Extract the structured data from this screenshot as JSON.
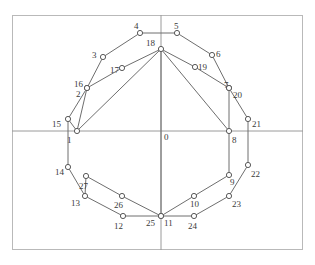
{
  "figure": {
    "title": "",
    "frame": {
      "x": 12,
      "y": 15,
      "width": 291,
      "height": 235,
      "border_color": "#b9b9b9"
    },
    "axes": {
      "x_axis_y": 131,
      "y_axis_x": 161,
      "color": "#9a9a9a",
      "origin_label": "0"
    },
    "style": {
      "edge_color": "#6e6e6e",
      "node_stroke": "#5a5a5a",
      "node_fill": "#ffffff",
      "label_color": "#3a3a3a",
      "background": "#ffffff"
    },
    "nodes": [
      {
        "id": "0",
        "label": "0",
        "x": 161,
        "y": 131,
        "marker": false,
        "lx": 164,
        "ly": 133
      },
      {
        "id": "1",
        "label": "1",
        "x": 77,
        "y": 131,
        "marker": true,
        "lx": 67,
        "ly": 136
      },
      {
        "id": "2",
        "label": "2",
        "x": 87,
        "y": 88,
        "marker": true,
        "lx": 76,
        "ly": 90
      },
      {
        "id": "3",
        "label": "3",
        "x": 103,
        "y": 57,
        "marker": true,
        "lx": 92,
        "ly": 51
      },
      {
        "id": "4",
        "label": "4",
        "x": 140,
        "y": 33,
        "marker": true,
        "lx": 134,
        "ly": 22
      },
      {
        "id": "5",
        "label": "5",
        "x": 177,
        "y": 33,
        "marker": true,
        "lx": 174,
        "ly": 22
      },
      {
        "id": "6",
        "label": "6",
        "x": 212,
        "y": 55,
        "marker": true,
        "lx": 216,
        "ly": 50
      },
      {
        "id": "7",
        "label": "7",
        "x": 229,
        "y": 88,
        "marker": true,
        "lx": 224,
        "ly": 81
      },
      {
        "id": "8",
        "label": "8",
        "x": 229,
        "y": 131,
        "marker": true,
        "lx": 232,
        "ly": 136
      },
      {
        "id": "9",
        "label": "9",
        "x": 229,
        "y": 175,
        "marker": true,
        "lx": 230,
        "ly": 178
      },
      {
        "id": "10",
        "label": "10",
        "x": 194,
        "y": 196,
        "marker": true,
        "lx": 190,
        "ly": 200
      },
      {
        "id": "11",
        "label": "11",
        "x": 161,
        "y": 216,
        "marker": true,
        "lx": 164,
        "ly": 219
      },
      {
        "id": "12",
        "label": "12",
        "x": 123,
        "y": 216,
        "marker": true,
        "lx": 114,
        "ly": 222
      },
      {
        "id": "13",
        "label": "13",
        "x": 85,
        "y": 196,
        "marker": true,
        "lx": 71,
        "ly": 199
      },
      {
        "id": "14",
        "label": "14",
        "x": 68,
        "y": 167,
        "marker": true,
        "lx": 55,
        "ly": 168
      },
      {
        "id": "15",
        "label": "15",
        "x": 68,
        "y": 119,
        "marker": true,
        "lx": 52,
        "ly": 120
      },
      {
        "id": "16",
        "label": "16",
        "x": 87,
        "y": 88,
        "marker": true,
        "lx": 74,
        "ly": 80
      },
      {
        "id": "17",
        "label": "17",
        "x": 122,
        "y": 68,
        "marker": true,
        "lx": 110,
        "ly": 66
      },
      {
        "id": "18",
        "label": "18",
        "x": 161,
        "y": 49,
        "marker": true,
        "lx": 146,
        "ly": 39
      },
      {
        "id": "19",
        "label": "19",
        "x": 195,
        "y": 67,
        "marker": true,
        "lx": 198,
        "ly": 63
      },
      {
        "id": "20",
        "label": "20",
        "x": 229,
        "y": 88,
        "marker": true,
        "lx": 233,
        "ly": 91
      },
      {
        "id": "21",
        "label": "21",
        "x": 248,
        "y": 119,
        "marker": true,
        "lx": 252,
        "ly": 120
      },
      {
        "id": "22",
        "label": "22",
        "x": 248,
        "y": 165,
        "marker": true,
        "lx": 251,
        "ly": 170
      },
      {
        "id": "23",
        "label": "23",
        "x": 229,
        "y": 196,
        "marker": true,
        "lx": 232,
        "ly": 200
      },
      {
        "id": "24",
        "label": "24",
        "x": 194,
        "y": 216,
        "marker": true,
        "lx": 188,
        "ly": 222
      },
      {
        "id": "25",
        "label": "25",
        "x": 161,
        "y": 216,
        "marker": true,
        "lx": 146,
        "ly": 219
      },
      {
        "id": "26",
        "label": "26",
        "x": 122,
        "y": 196,
        "marker": true,
        "lx": 114,
        "ly": 201
      },
      {
        "id": "27",
        "label": "27",
        "x": 86,
        "y": 176,
        "marker": true,
        "lx": 79,
        "ly": 182
      }
    ],
    "edges_inner": [
      [
        "1",
        "2"
      ],
      [
        "2",
        "3"
      ],
      [
        "3",
        "4"
      ],
      [
        "4",
        "5"
      ],
      [
        "5",
        "6"
      ],
      [
        "6",
        "7"
      ],
      [
        "7",
        "8"
      ],
      [
        "8",
        "9"
      ],
      [
        "9",
        "10"
      ],
      [
        "10",
        "11"
      ],
      [
        "11",
        "12"
      ],
      [
        "12",
        "13"
      ],
      [
        "13",
        "14"
      ],
      [
        "14",
        "15"
      ],
      [
        "15",
        "1"
      ]
    ],
    "edges_outer": [
      [
        "15",
        "16"
      ],
      [
        "16",
        "17"
      ],
      [
        "17",
        "18"
      ],
      [
        "18",
        "19"
      ],
      [
        "19",
        "20"
      ],
      [
        "20",
        "21"
      ],
      [
        "21",
        "22"
      ],
      [
        "22",
        "23"
      ],
      [
        "23",
        "24"
      ],
      [
        "24",
        "25"
      ],
      [
        "25",
        "26"
      ],
      [
        "26",
        "27"
      ],
      [
        "27",
        "13"
      ]
    ],
    "edges_spokes": [
      [
        "1",
        "18"
      ],
      [
        "11",
        "18"
      ],
      [
        "8",
        "18"
      ]
    ]
  }
}
